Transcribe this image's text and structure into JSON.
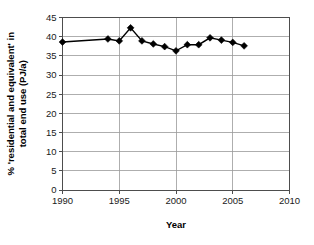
{
  "chart_data": {
    "type": "line",
    "title": "",
    "subtitle": "",
    "xlabel": "Year",
    "ylabel": "% 'residential and equivalent' in total end use (PJ/a)",
    "ylabel_lines": [
      "% 'residential and equivalent' in",
      "total end use (PJ/a)"
    ],
    "xlim": [
      1990,
      2010
    ],
    "ylim": [
      0,
      45
    ],
    "xticks": [
      1990,
      1995,
      2000,
      2005,
      2010
    ],
    "yticks": [
      0,
      5,
      10,
      15,
      20,
      25,
      30,
      35,
      40,
      45
    ],
    "xtick_labels": [
      "1990",
      "1995",
      "2000",
      "2005",
      "2010"
    ],
    "ytick_labels": [
      "0",
      "5",
      "10",
      "15",
      "20",
      "25",
      "30",
      "35",
      "40",
      "45"
    ],
    "grid": {
      "horizontal": true,
      "vertical": true
    },
    "legend": {
      "visible": false,
      "position": "none"
    },
    "marker": "diamond",
    "marker_color": "#000000",
    "line_color": "#000000",
    "x": [
      1990,
      1994,
      1995,
      1996,
      1997,
      1998,
      1999,
      2000,
      2001,
      2002,
      2003,
      2004,
      2005,
      2006
    ],
    "values": [
      38.6,
      39.4,
      38.9,
      42.3,
      38.9,
      38.1,
      37.4,
      36.3,
      37.9,
      37.9,
      39.7,
      39.1,
      38.5,
      37.6
    ],
    "series": [
      {
        "name": "% 'residential and equivalent' in total end use",
        "x": [
          1990,
          1994,
          1995,
          1996,
          1997,
          1998,
          1999,
          2000,
          2001,
          2002,
          2003,
          2004,
          2005,
          2006
        ],
        "values": [
          38.6,
          39.4,
          38.9,
          42.3,
          38.9,
          38.1,
          37.4,
          36.3,
          37.9,
          37.9,
          39.7,
          39.1,
          38.5,
          37.6
        ]
      }
    ],
    "annotations": []
  },
  "colors": {
    "background": "#ffffff",
    "axis": "#4d4d4d",
    "grid": "#9a9a9a",
    "series": "#000000",
    "text": "#1a1a1a"
  }
}
